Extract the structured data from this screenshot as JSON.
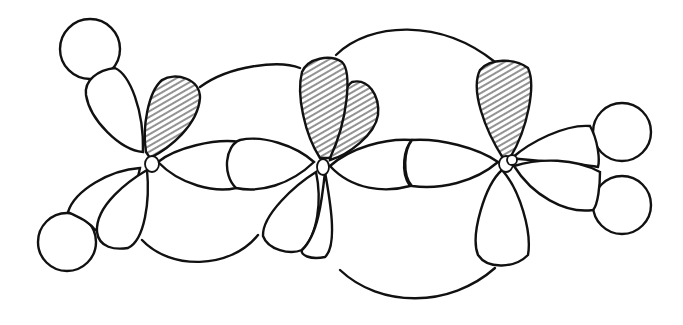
{
  "diagram": {
    "title": "",
    "type": "molecular-orbital-sketch",
    "colors": {
      "line": "#111111",
      "hatch": "#888888",
      "background": "#ffffff"
    },
    "atoms": [
      {
        "id": "C1",
        "x": 150,
        "y": 162
      },
      {
        "id": "C2",
        "x": 322,
        "y": 165
      },
      {
        "id": "C3",
        "x": 505,
        "y": 162
      }
    ],
    "hydrogens": [
      {
        "id": "H1",
        "cx": 90,
        "cy": 49,
        "r": 30
      },
      {
        "id": "H2",
        "cx": 67,
        "cy": 242,
        "r": 30
      },
      {
        "id": "H3",
        "cx": 622,
        "cy": 132,
        "r": 30
      },
      {
        "id": "H4",
        "cx": 622,
        "cy": 205,
        "r": 30
      }
    ],
    "p_orbitals": [
      {
        "atom": "C1",
        "shaded": true
      },
      {
        "atom": "C2",
        "shaded": true
      },
      {
        "atom": "C3",
        "shaded": true
      }
    ],
    "labels": []
  }
}
